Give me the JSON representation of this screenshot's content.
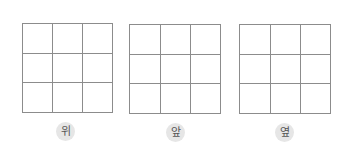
{
  "views": [
    {
      "label": "위",
      "rows": 3,
      "cols": 3
    },
    {
      "label": "앞",
      "rows": 3,
      "cols": 3
    },
    {
      "label": "옆",
      "rows": 3,
      "cols": 3
    }
  ],
  "colors": {
    "grid_line": "#8c8c8c",
    "label_bg": "#e6e6e6",
    "label_text": "#555555"
  }
}
